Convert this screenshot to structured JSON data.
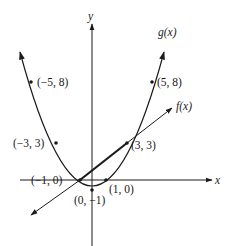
{
  "figure": {
    "axes": {
      "x_label": "x",
      "y_label": "y",
      "origin_px": [
        92,
        180
      ],
      "unit_px": [
        12,
        12.2
      ]
    },
    "functions": [
      {
        "id": "g",
        "label": "g(x)",
        "type": "parabola",
        "description": "g(x) = x^2 - 1"
      },
      {
        "id": "f",
        "label": "f(x)",
        "type": "line",
        "description": "line through (-1, 0) and (3, 3)"
      }
    ],
    "points": [
      {
        "x": -5,
        "y": 8,
        "label": "(−5, 8)"
      },
      {
        "x": 5,
        "y": 8,
        "label": "(5, 8)"
      },
      {
        "x": -3,
        "y": 3,
        "label": "(−3, 3)"
      },
      {
        "x": 3,
        "y": 3,
        "label": "(3, 3)"
      },
      {
        "x": -1,
        "y": 0,
        "label": "(−1, 0)"
      },
      {
        "x": 1,
        "y": 0,
        "label": "(1, 0)"
      },
      {
        "x": 0,
        "y": -1,
        "label": "(0, −1)"
      }
    ],
    "colors": {
      "ink": "#1a1a1a",
      "background": "#ffffff"
    }
  }
}
